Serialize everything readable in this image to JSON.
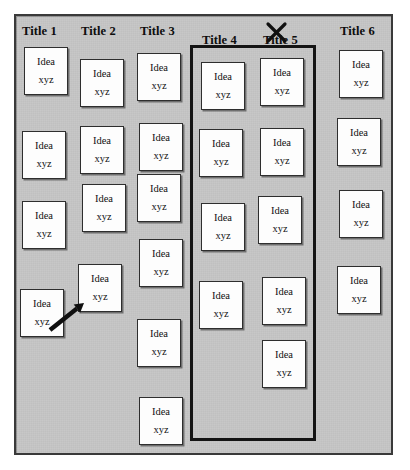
{
  "board": {
    "type": "affinity-diagram",
    "background_color": "#c4c4c4",
    "frame_color": "#3a3a3a",
    "card_label_top": "Idea",
    "card_label_bottom": "xyz",
    "columns": [
      {
        "title": "Title 1",
        "title_x": 22,
        "title_y": 24,
        "card_count": 4,
        "cards": [
          {
            "x": 24,
            "y": 47
          },
          {
            "x": 22,
            "y": 131
          },
          {
            "x": 22,
            "y": 201
          },
          {
            "x": 20,
            "y": 289
          }
        ]
      },
      {
        "title": "Title 2",
        "title_x": 81,
        "title_y": 24,
        "card_count": 4,
        "cards": [
          {
            "x": 80,
            "y": 59
          },
          {
            "x": 80,
            "y": 126
          },
          {
            "x": 82,
            "y": 184
          },
          {
            "x": 78,
            "y": 264
          }
        ]
      },
      {
        "title": "Title 3",
        "title_x": 140,
        "title_y": 24,
        "card_count": 6,
        "cards": [
          {
            "x": 137,
            "y": 53
          },
          {
            "x": 139,
            "y": 123
          },
          {
            "x": 137,
            "y": 174
          },
          {
            "x": 139,
            "y": 239
          },
          {
            "x": 137,
            "y": 319
          },
          {
            "x": 139,
            "y": 397
          }
        ]
      },
      {
        "title": "Title 4",
        "title_x": 202,
        "title_y": 33,
        "card_count": 4,
        "cards": [
          {
            "x": 201,
            "y": 62
          },
          {
            "x": 199,
            "y": 129
          },
          {
            "x": 201,
            "y": 203
          },
          {
            "x": 199,
            "y": 281
          }
        ]
      },
      {
        "title": "Title 5",
        "title_x": 263,
        "title_y": 33,
        "card_count": 5,
        "crossed_out": true,
        "cards": [
          {
            "x": 260,
            "y": 58
          },
          {
            "x": 260,
            "y": 128
          },
          {
            "x": 258,
            "y": 196
          },
          {
            "x": 262,
            "y": 277
          },
          {
            "x": 262,
            "y": 340
          }
        ]
      },
      {
        "title": "Title 6",
        "title_x": 340,
        "title_y": 24,
        "card_count": 4,
        "cards": [
          {
            "x": 339,
            "y": 50
          },
          {
            "x": 337,
            "y": 118
          },
          {
            "x": 339,
            "y": 190
          },
          {
            "x": 337,
            "y": 266
          }
        ]
      }
    ],
    "group_box": {
      "label": "grouping-box-title4-title5",
      "x": 190,
      "y": 45,
      "width": 126,
      "height": 396,
      "color": "#141414",
      "thickness": 3
    },
    "annotations": [
      {
        "kind": "move-arrow",
        "label": "arrow-card-move",
        "from_x": 50,
        "from_y": 330,
        "to_x": 84,
        "to_y": 303,
        "color": "#101010"
      },
      {
        "kind": "cross-out",
        "label": "cross-out-title5",
        "x": 268,
        "y": 24,
        "size": 17,
        "color": "#101010"
      }
    ]
  }
}
